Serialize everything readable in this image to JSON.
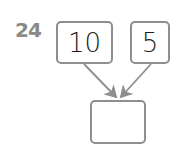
{
  "problem": {
    "number": "24",
    "inputs": [
      "10",
      "5"
    ],
    "result": ""
  },
  "colors": {
    "border": "#8e8e8e",
    "number": "#8a8a8a",
    "text": "#1a1a1a"
  }
}
